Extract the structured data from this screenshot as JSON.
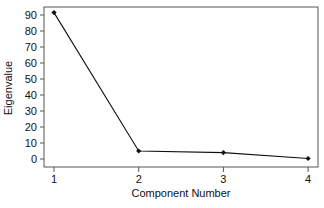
{
  "chart_data": {
    "type": "line",
    "title": "",
    "xlabel": "Component Number",
    "ylabel": "Eigenvalue",
    "x": [
      1,
      2,
      3,
      4
    ],
    "x_tick_labels": [
      "1",
      "2",
      "3",
      "4"
    ],
    "y_tick_labels": [
      "0",
      "10",
      "20",
      "30",
      "40",
      "50",
      "60",
      "70",
      "80",
      "90"
    ],
    "y_ticks": [
      0,
      10,
      20,
      30,
      40,
      50,
      60,
      70,
      80,
      90
    ],
    "series": [
      {
        "name": "Eigenvalue",
        "values": [
          91.5,
          5,
          4,
          0.3
        ],
        "marker": "diamond",
        "color": "#111111"
      }
    ],
    "xlim": [
      0.88,
      4.12
    ],
    "ylim": [
      -5,
      95
    ],
    "grid": false,
    "legend": null
  }
}
